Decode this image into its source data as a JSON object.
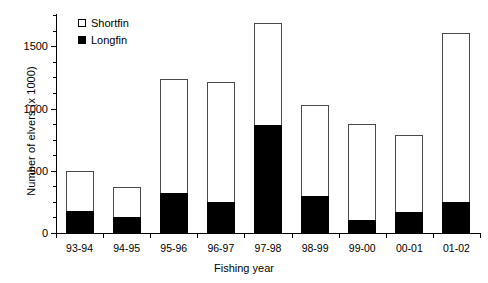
{
  "chart_data": {
    "type": "bar",
    "stacked": true,
    "title": "",
    "xlabel": "Fishing year",
    "ylabel": "Number of elvers (x 1000)",
    "categories": [
      "93-94",
      "94-95",
      "95-96",
      "96-97",
      "97-98",
      "98-99",
      "99-00",
      "00-01",
      "01-02"
    ],
    "series": [
      {
        "name": "Longfin",
        "color": "#000000",
        "values": [
          180,
          130,
          325,
          250,
          870,
          300,
          105,
          165,
          250
        ]
      },
      {
        "name": "Shortfin",
        "color": "#ffffff",
        "values": [
          320,
          240,
          915,
          965,
          820,
          725,
          770,
          625,
          1360
        ]
      }
    ],
    "totals": [
      500,
      370,
      1240,
      1215,
      1690,
      1025,
      875,
      790,
      1610
    ],
    "ylim": [
      0,
      1760
    ],
    "yticks": [
      0,
      500,
      1000,
      1500
    ],
    "ytick_labels": [
      "0",
      "500",
      "1000",
      "1500"
    ],
    "yminor_step": 125,
    "grid": false,
    "legend": {
      "position": "top-left-inside",
      "entries": [
        {
          "label": "Shortfin",
          "marker": "open-square"
        },
        {
          "label": "Longfin",
          "marker": "filled-square"
        }
      ]
    }
  }
}
